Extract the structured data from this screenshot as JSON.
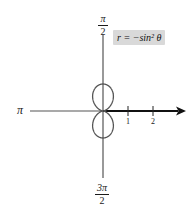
{
  "chart_data": {
    "type": "line",
    "subtype": "polar",
    "title": "",
    "equation_label": "r = −sin² θ",
    "angle_labels": {
      "top": {
        "num": "π",
        "den": "2"
      },
      "left": "π",
      "bottom": {
        "num": "3π",
        "den": "2"
      }
    },
    "radial_ticks": [
      "1",
      "2"
    ],
    "radial_range": [
      0,
      2
    ],
    "curve": "r = -sin^2(theta), figure-eight along vertical axis, loops of radius 1 above and below pole",
    "colors": {
      "curve": "#555555",
      "axis": "#555555",
      "arrow": "#111111",
      "label_bg": "#d9d9d9"
    }
  },
  "labels": {
    "top_num": "π",
    "top_den": "2",
    "left": "π",
    "bottom_num": "3π",
    "bottom_den": "2",
    "tick1": "1",
    "tick2": "2",
    "equation": "r = −sin² θ"
  }
}
